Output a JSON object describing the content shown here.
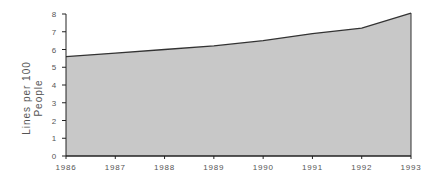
{
  "chart_data": {
    "type": "area",
    "title": "",
    "xlabel": "",
    "ylabel": "Lines per 100 People",
    "ylabel_lines": [
      "Lines per 100",
      "People"
    ],
    "categories": [
      "1986",
      "1987",
      "1988",
      "1989",
      "1990",
      "1991",
      "1992",
      "1993"
    ],
    "series": [
      {
        "name": "Lines per 100 People",
        "values": [
          5.6,
          5.8,
          6.0,
          6.2,
          6.5,
          6.9,
          7.2,
          8.05
        ]
      }
    ],
    "ylim": [
      0,
      8
    ],
    "yticks": [
      0,
      1,
      2,
      3,
      4,
      5,
      6,
      7,
      8
    ],
    "grid": false,
    "legend": "none",
    "colors": {
      "fill": "#c8c8c8",
      "line": "#333333",
      "axis": "#222222",
      "text": "#555555"
    }
  }
}
